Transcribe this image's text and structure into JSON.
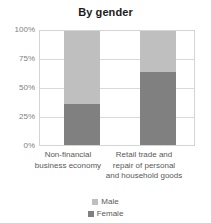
{
  "chart_data": {
    "type": "bar",
    "subtype": "stacked-percentage",
    "title": "By gender",
    "xlabel": "",
    "ylabel": "",
    "ylim": [
      0,
      100
    ],
    "yunit": "%",
    "grid": true,
    "legend_position": "bottom",
    "categories": [
      "Non-financial business economy",
      "Retail trade and repair of personal and household goods"
    ],
    "category_label_lines": [
      [
        "Non-financial",
        "business economy"
      ],
      [
        "Retail trade and",
        "repair of personal",
        "and household goods"
      ]
    ],
    "ytick_labels": [
      "100%",
      "75%",
      "50%",
      "25%",
      "0%"
    ],
    "ytick_values": [
      100,
      75,
      50,
      25,
      0
    ],
    "series": [
      {
        "name": "Male",
        "color": "#bfbfbf",
        "values": [
          65,
          37
        ]
      },
      {
        "name": "Female",
        "color": "#808080",
        "values": [
          35,
          63
        ]
      }
    ]
  },
  "legend": {
    "items": [
      {
        "label": "Male",
        "color": "#bfbfbf"
      },
      {
        "label": "Female",
        "color": "#808080"
      }
    ]
  }
}
